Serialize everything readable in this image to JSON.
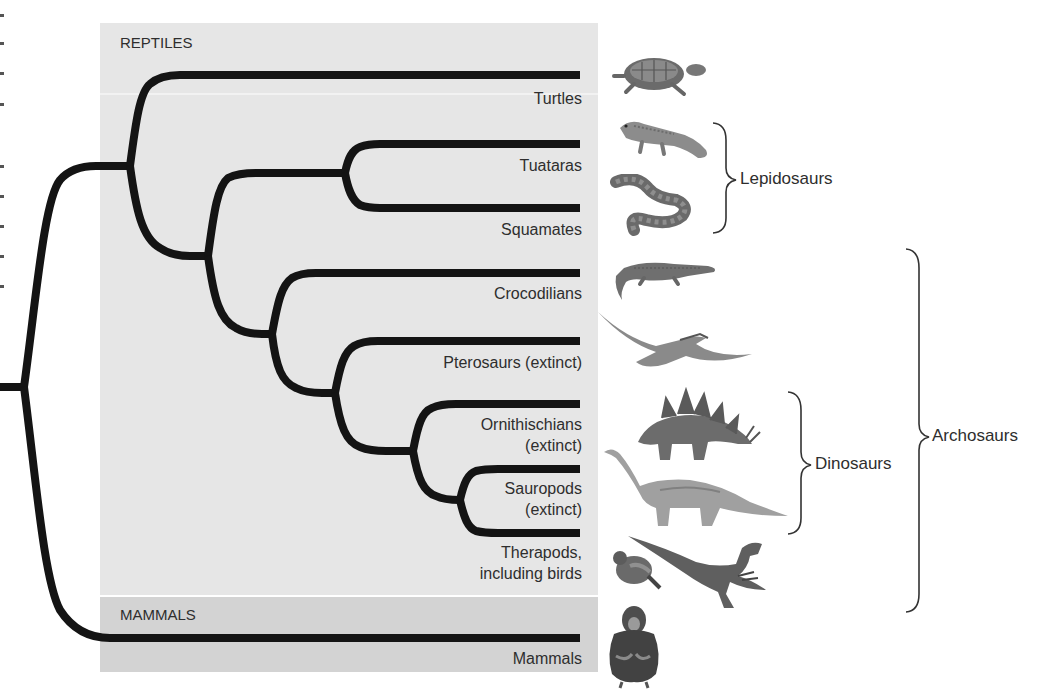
{
  "groups": {
    "reptiles": "REPTILES",
    "mammals": "MAMMALS"
  },
  "taxa": [
    {
      "id": "turtles",
      "label": "Turtles",
      "icon": "turtle-icon"
    },
    {
      "id": "tuataras",
      "label": "Tuataras",
      "icon": "tuatara-icon"
    },
    {
      "id": "squamates",
      "label": "Squamates",
      "icon": "snake-icon"
    },
    {
      "id": "crocodilians",
      "label": "Crocodilians",
      "icon": "crocodile-icon"
    },
    {
      "id": "pterosaurs",
      "label": "Pterosaurs (extinct)",
      "icon": "pterosaur-icon"
    },
    {
      "id": "ornithischians",
      "label_line1": "Ornithischians",
      "label_line2": "(extinct)",
      "icon": "stegosaurus-icon"
    },
    {
      "id": "sauropods",
      "label_line1": "Sauropods",
      "label_line2": "(extinct)",
      "icon": "sauropod-icon"
    },
    {
      "id": "therapods",
      "label_line1": "Therapods,",
      "label_line2": "including birds",
      "icon": "pigeon-and-raptor-icon"
    },
    {
      "id": "mammals",
      "label": "Mammals",
      "icon": "chimpanzee-icon"
    }
  ],
  "clades": {
    "lepidosaurs": "Lepidosaurs",
    "dinosaurs": "Dinosaurs",
    "archosaurs": "Archosaurs"
  },
  "colors": {
    "reptile_band": "#e6e6e6",
    "mammal_band": "#d3d3d3",
    "branch": "#141414"
  }
}
